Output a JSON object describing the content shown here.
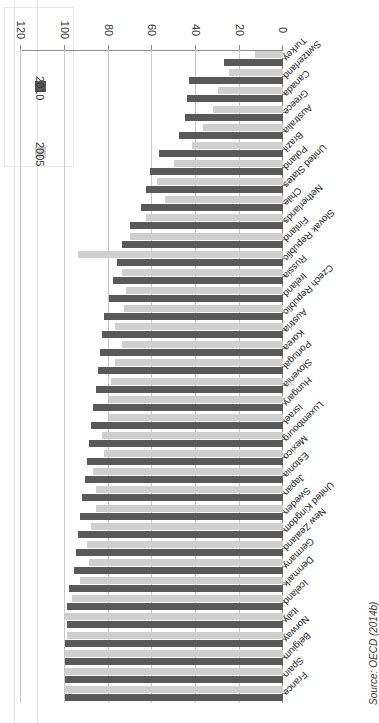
{
  "figure": {
    "source_note": "Source: OECD (2014b)",
    "rotation_degrees": 180
  },
  "legend": {
    "title": "",
    "position": "top-left-rotated",
    "entries": [
      {
        "label": "2005",
        "color": "#cfcfcf",
        "swatch_name": "legend-swatch-2005"
      },
      {
        "label": "2010",
        "color": "#595959",
        "swatch_name": "legend-swatch-2010"
      }
    ]
  },
  "chart_data": {
    "type": "bar",
    "orientation": "horizontal",
    "title": "",
    "xlabel": "",
    "ylabel": "",
    "xlim": [
      0,
      120
    ],
    "xticks": [
      0,
      20,
      40,
      60,
      80,
      100,
      120
    ],
    "tick_labels": [
      "0",
      "20",
      "40",
      "60",
      "80",
      "100",
      "120"
    ],
    "grid": true,
    "legend_position": "upper right",
    "categories": [
      "France",
      "Spain",
      "Belgium",
      "Norway",
      "Italy",
      "Iceland",
      "Denmark",
      "Germany",
      "New Zealand",
      "United Kingdom",
      "Sweden",
      "Japan",
      "Estonia",
      "Mexico",
      "Luxembourg",
      "Israel",
      "Hungary",
      "Slovenia",
      "Portugal",
      "Korea",
      "Austria",
      "Czech Republic",
      "Ireland",
      "Russia",
      "Slovak Republic",
      "Finland",
      "Netherlands",
      "Chile",
      "United States",
      "Poland",
      "Brazil",
      "Australia",
      "Greece",
      "Canada",
      "Switzerland",
      "Turkey"
    ],
    "series": [
      {
        "name": "2005",
        "color": "#cfcfcf",
        "values": [
          100,
          100,
          100,
          99,
          100,
          97,
          93,
          89,
          90,
          88,
          86,
          86,
          87,
          82,
          83,
          80,
          80,
          79,
          77,
          74,
          77,
          73,
          72,
          74,
          94,
          70,
          63,
          54,
          58,
          50,
          42,
          37,
          32,
          30,
          25,
          13
        ]
      },
      {
        "name": "2010",
        "color": "#595959",
        "values": [
          100,
          100,
          100,
          100,
          99,
          99,
          98,
          96,
          95,
          94,
          93,
          92,
          91,
          90,
          89,
          88,
          87,
          86,
          85,
          84,
          83,
          82,
          80,
          78,
          76,
          74,
          70,
          65,
          63,
          61,
          57,
          48,
          45,
          44,
          43,
          27
        ]
      }
    ]
  }
}
